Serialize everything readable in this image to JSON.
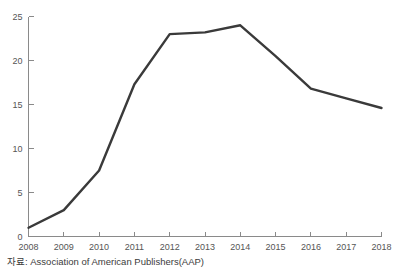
{
  "figure": {
    "cropped_title_fragment": "",
    "source_caption": "자료: Association of American Publishers(AAP)"
  },
  "chart_data": {
    "type": "line",
    "title": "",
    "subtitle": "",
    "xlabel": "",
    "ylabel": "",
    "categories": [
      "2008",
      "2009",
      "2010",
      "2011",
      "2012",
      "2013",
      "2014",
      "2015",
      "2016",
      "2017",
      "2018"
    ],
    "values": [
      1.0,
      3.0,
      7.5,
      17.3,
      23.0,
      23.2,
      24.0,
      20.5,
      16.8,
      15.7,
      14.6
    ],
    "series": [
      {
        "name": "",
        "values": [
          1.0,
          3.0,
          7.5,
          17.3,
          23.0,
          23.2,
          24.0,
          20.5,
          16.8,
          15.7,
          14.6
        ],
        "color": "#3a3a3a"
      }
    ],
    "x_tick_labels": [
      "2008",
      "2009",
      "2010",
      "2011",
      "2012",
      "2013",
      "2014",
      "2015",
      "2016",
      "2017",
      "2018"
    ],
    "y_tick_labels": [
      "0",
      "5",
      "10",
      "15",
      "20",
      "25"
    ],
    "y_ticks": [
      0,
      5,
      10,
      15,
      20,
      25
    ],
    "ylim": [
      0,
      25
    ],
    "xlim": [
      "2008",
      "2018"
    ],
    "grid": false,
    "legend": false,
    "legend_position": "none",
    "line_color": "#3a3a3a",
    "axis_color": "#8a8a8a",
    "background_color": "#ffffff",
    "annotations": []
  }
}
